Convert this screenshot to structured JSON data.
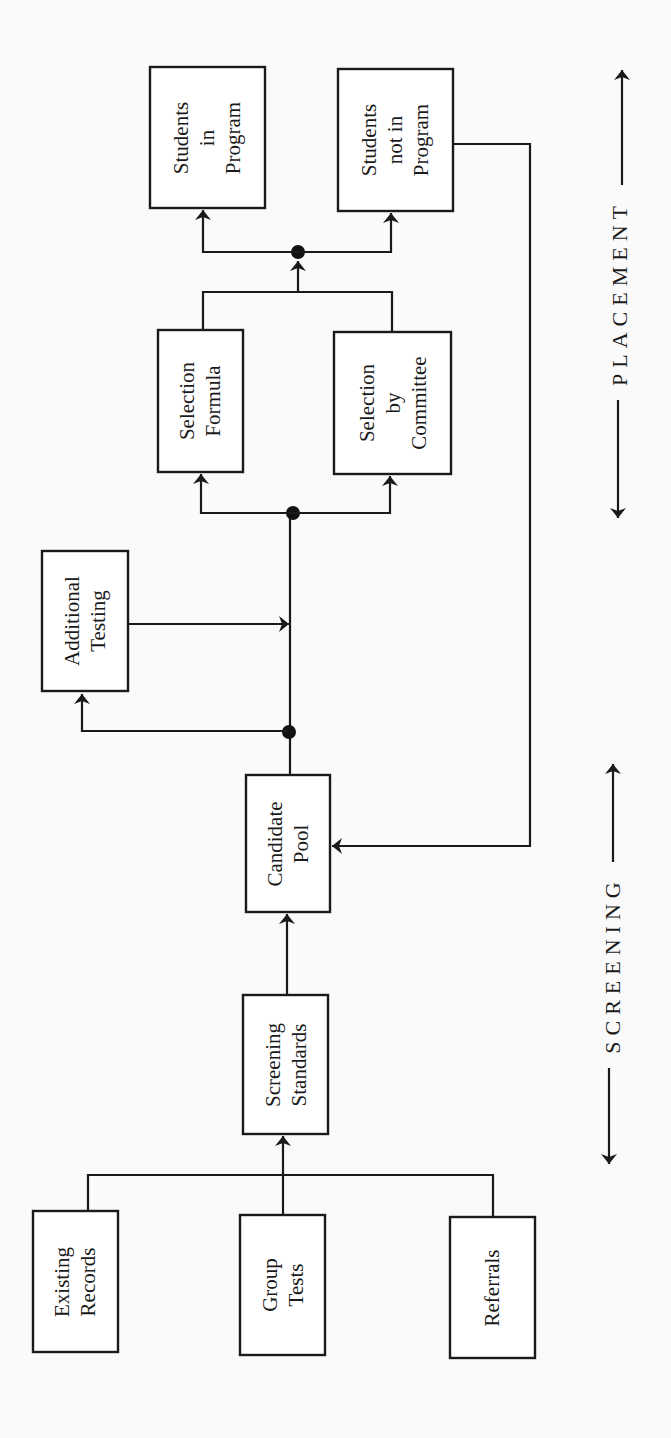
{
  "diagram": {
    "title": "",
    "colors": {
      "ink": "#1a1a1a",
      "background": "#fafafa",
      "box_fill": "#ffffff"
    },
    "phases": {
      "placement": "PLACEMENT",
      "screening": "SCREENING"
    },
    "nodes": {
      "students_in_program": {
        "lines": [
          "Students",
          "in",
          "Program"
        ]
      },
      "students_not_in_program": {
        "lines": [
          "Students",
          "not in",
          "Program"
        ]
      },
      "selection_formula": {
        "lines": [
          "Selection",
          "Formula"
        ]
      },
      "selection_by_committee": {
        "lines": [
          "Selection",
          "by",
          "Committee"
        ]
      },
      "additional_testing": {
        "lines": [
          "Additional",
          "Testing"
        ]
      },
      "candidate_pool": {
        "lines": [
          "Candidate",
          "Pool"
        ]
      },
      "screening_standards": {
        "lines": [
          "Screening",
          "Standards"
        ]
      },
      "existing_records": {
        "lines": [
          "Existing",
          "Records"
        ]
      },
      "group_tests": {
        "lines": [
          "Group",
          "Tests"
        ]
      },
      "referrals": {
        "lines": [
          "Referrals"
        ]
      }
    },
    "edges": [
      {
        "from": "existing_records",
        "to": "screening_standards"
      },
      {
        "from": "group_tests",
        "to": "screening_standards"
      },
      {
        "from": "referrals",
        "to": "screening_standards"
      },
      {
        "from": "screening_standards",
        "to": "candidate_pool"
      },
      {
        "from": "candidate_pool",
        "to": "additional_testing"
      },
      {
        "from": "additional_testing",
        "to": "selection_junction"
      },
      {
        "from": "candidate_pool",
        "to": "selection_formula"
      },
      {
        "from": "candidate_pool",
        "to": "selection_by_committee"
      },
      {
        "from": "selection_formula",
        "to": "students_in_program"
      },
      {
        "from": "selection_formula",
        "to": "students_not_in_program"
      },
      {
        "from": "selection_by_committee",
        "to": "students_in_program"
      },
      {
        "from": "selection_by_committee",
        "to": "students_not_in_program"
      },
      {
        "from": "students_not_in_program",
        "to": "candidate_pool"
      }
    ]
  }
}
